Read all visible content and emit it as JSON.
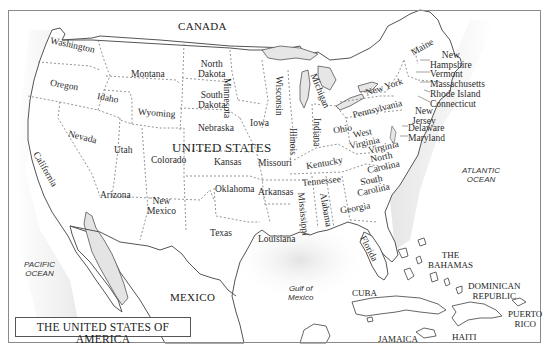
{
  "map": {
    "title": "THE UNITED STATES OF AMERICA",
    "country_main": "UNITED STATES",
    "countries": {
      "canada": "CANADA",
      "mexico": "MEXICO",
      "cuba": "CUBA",
      "bahamas": [
        "THE",
        "BAHAMAS"
      ],
      "dominican_republic": [
        "DOMINICAN",
        "REPUBLIC"
      ],
      "puerto_rico": [
        "PUERTO",
        "RICO"
      ],
      "haiti": "HAITI",
      "jamaica": "JAMAICA"
    },
    "water": {
      "pacific": [
        "PACIFIC",
        "OCEAN"
      ],
      "atlantic": [
        "ATLANTIC",
        "OCEAN"
      ],
      "gulf": [
        "Gulf of",
        "Mexico"
      ]
    },
    "states": {
      "washington": "Washington",
      "oregon": "Oregon",
      "california": "California",
      "idaho": "Idaho",
      "nevada": "Nevada",
      "montana": "Montana",
      "wyoming": "Wyoming",
      "utah": "Utah",
      "arizona": "Arizona",
      "colorado": "Colorado",
      "new_mexico": [
        "New",
        "Mexico"
      ],
      "north_dakota": [
        "North",
        "Dakota"
      ],
      "south_dakota": [
        "South",
        "Dakota"
      ],
      "nebraska": "Nebraska",
      "kansas": "Kansas",
      "oklahoma": "Oklahoma",
      "texas": "Texas",
      "minnesota": "Minnesota",
      "iowa": "Iowa",
      "missouri": "Missouri",
      "arkansas": "Arkansas",
      "louisiana": "Louisiana",
      "wisconsin": "Wisconsin",
      "illinois": "Illinois",
      "michigan": "Michigan",
      "indiana": "Indiana",
      "ohio": "Ohio",
      "kentucky": "Kentucky",
      "tennessee": "Tennessee",
      "mississippi": "Mississippi",
      "alabama": "Alabama",
      "georgia": "Georgia",
      "florida": "Florida",
      "south_carolina": [
        "South",
        "Carolina"
      ],
      "north_carolina": [
        "North",
        "Carolina"
      ],
      "virginia": "Virginia",
      "west_virginia": [
        "West",
        "Virginia"
      ],
      "pennsylvania": "Pennsylvania",
      "new_york": "New York",
      "maine": "Maine",
      "new_hampshire": [
        "New",
        "Hampshire"
      ],
      "vermont": "Vermont",
      "massachusetts": "Massachusetts",
      "rhode_island": "Rhode Island",
      "connecticut": "Connecticut",
      "new_jersey": [
        "New",
        "Jersey"
      ],
      "delaware": "Delaware",
      "maryland": "Maryland"
    }
  }
}
